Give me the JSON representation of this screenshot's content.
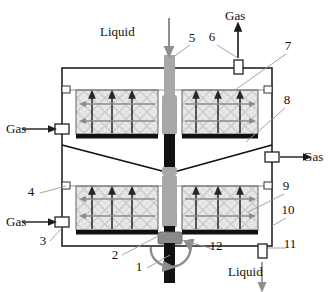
{
  "figure": {
    "type": "cross-section schematic"
  },
  "flow_labels": {
    "liquid_in": "Liquid",
    "gas_out_top": "Gas",
    "gas_in_upper_left": "Gas",
    "gas_in_lower_left": "Gas",
    "gas_out_right": "Gas",
    "liquid_out": "Liquid"
  },
  "callouts": [
    {
      "id": "1",
      "text": "1",
      "x": 139,
      "y": 271,
      "leader": [
        [
          147,
          268
        ],
        [
          170,
          255
        ]
      ],
      "refers_to": "drive-shaft"
    },
    {
      "id": "2",
      "text": "2",
      "x": 115,
      "y": 259,
      "leader": [
        [
          122,
          255
        ],
        [
          166,
          232
        ]
      ],
      "refers_to": "lower-rotor-hub"
    },
    {
      "id": "3",
      "text": "3",
      "x": 43,
      "y": 245,
      "leader": [
        [
          50,
          241
        ],
        [
          62,
          228
        ]
      ],
      "refers_to": "lower-gas-inlet-port"
    },
    {
      "id": "4",
      "text": "4",
      "x": 31,
      "y": 196,
      "leader": [
        [
          40,
          193
        ],
        [
          66,
          186
        ]
      ],
      "refers_to": "vessel-wall-port-left"
    },
    {
      "id": "5",
      "text": "5",
      "x": 192,
      "y": 42,
      "leader": [
        [
          190,
          45
        ],
        [
          172,
          58
        ]
      ],
      "refers_to": "liquid-feed-pipe"
    },
    {
      "id": "6",
      "text": "6",
      "x": 212,
      "y": 41,
      "leader": [
        [
          217,
          45
        ],
        [
          238,
          58
        ]
      ],
      "refers_to": "gas-outlet-port-top"
    },
    {
      "id": "7",
      "text": "7",
      "x": 288,
      "y": 50,
      "leader": [
        [
          286,
          54
        ],
        [
          235,
          90
        ]
      ],
      "refers_to": "upper-packed-bed"
    },
    {
      "id": "8",
      "text": "8",
      "x": 287,
      "y": 104,
      "leader": [
        [
          285,
          108
        ],
        [
          246,
          142
        ]
      ],
      "refers_to": "liquid-collection-cone"
    },
    {
      "id": "9",
      "text": "9",
      "x": 286,
      "y": 190,
      "leader": [
        [
          284,
          194
        ],
        [
          248,
          212
        ]
      ],
      "refers_to": "lower-packed-bed"
    },
    {
      "id": "10",
      "text": "10",
      "x": 288,
      "y": 214,
      "leader": [
        [
          286,
          218
        ],
        [
          272,
          226
        ]
      ],
      "refers_to": "vessel-shell"
    },
    {
      "id": "11",
      "text": "11",
      "x": 290,
      "y": 248,
      "leader": [
        [
          286,
          248
        ],
        [
          268,
          248
        ]
      ],
      "refers_to": "liquid-outlet-port"
    },
    {
      "id": "12",
      "text": "12",
      "x": 216,
      "y": 250,
      "leader": [
        [
          213,
          249
        ],
        [
          182,
          240
        ]
      ],
      "refers_to": "shaft-seal"
    }
  ],
  "colors": {
    "shell_line": "#222222",
    "shaft_black": "#111111",
    "shaft_gray": "#a6a6a6",
    "packing_fill": "#e6e6e6",
    "packing_lattice": "#c9c9c9",
    "bed_plate": "#111111",
    "arrow_dark": "#262626",
    "arrow_gray": "#8c8c8c",
    "leader_line": "#9a9a9a",
    "flow_arrow": "#8f8f8f"
  },
  "geometry": {
    "vessel": {
      "x": 62,
      "y": 68,
      "width": 210,
      "height": 178
    },
    "upper_bed": {
      "x": 76,
      "y": 90,
      "width": 182,
      "height": 44
    },
    "lower_bed": {
      "x": 76,
      "y": 186,
      "width": 182,
      "height": 44
    },
    "shaft_x": 170
  },
  "flow_arrow_counts": {
    "bed_vertical_arrows_per_side": 3,
    "bed_horizontal_arrows_per_side": 2
  }
}
